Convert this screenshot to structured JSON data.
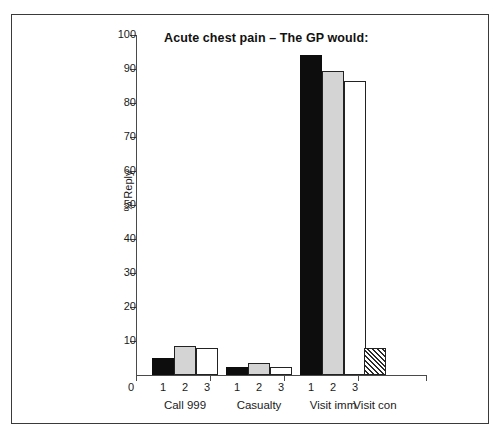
{
  "chart_data": {
    "type": "bar",
    "title": "Acute chest pain – The GP would:",
    "xlabel": "",
    "ylabel": "% Reply",
    "ylim": [
      0,
      100
    ],
    "ytick_step": 10,
    "ytick_labels": [
      "0",
      "10",
      "20",
      "30",
      "40",
      "50",
      "60",
      "70",
      "80",
      "90",
      "100"
    ],
    "grid": false,
    "legend": "none",
    "categories": [
      "Call 999",
      "Casualty",
      "Visit imm",
      "Visit con"
    ],
    "sub_labels": [
      "1",
      "2",
      "3"
    ],
    "series": [
      {
        "name": "1",
        "fill": "black",
        "values": [
          5,
          2.5,
          94,
          null
        ]
      },
      {
        "name": "2",
        "fill": "grey",
        "values": [
          8.5,
          3.5,
          89.5,
          null
        ]
      },
      {
        "name": "3",
        "fill": "white",
        "values": [
          8,
          2.5,
          86.5,
          null
        ]
      },
      {
        "name": "hatched",
        "fill": "hatch",
        "values": [
          null,
          null,
          null,
          8
        ]
      }
    ],
    "groups": [
      {
        "label": "Call 999",
        "bars": [
          {
            "sub_label": "1",
            "value": 5,
            "fill": "black"
          },
          {
            "sub_label": "2",
            "value": 8.5,
            "fill": "grey"
          },
          {
            "sub_label": "3",
            "value": 8,
            "fill": "white"
          }
        ]
      },
      {
        "label": "Casualty",
        "bars": [
          {
            "sub_label": "1",
            "value": 2.5,
            "fill": "black"
          },
          {
            "sub_label": "2",
            "value": 3.5,
            "fill": "grey"
          },
          {
            "sub_label": "3",
            "value": 2.5,
            "fill": "white"
          }
        ]
      },
      {
        "label": "Visit imm",
        "bars": [
          {
            "sub_label": "1",
            "value": 94,
            "fill": "black"
          },
          {
            "sub_label": "2",
            "value": 89.5,
            "fill": "grey"
          },
          {
            "sub_label": "3",
            "value": 86.5,
            "fill": "white"
          }
        ]
      },
      {
        "label": "Visit con",
        "bars": [
          {
            "sub_label": "",
            "value": 8,
            "fill": "hatch"
          }
        ]
      }
    ],
    "colors": {
      "series_1": "#0d0d0d",
      "series_2": "#d4d4d4",
      "series_3": "#ffffff",
      "hatch": "#2b2b2b",
      "axis": "#4a4a4a",
      "text": "#1a1a1a",
      "frame": "#3a3a3a",
      "background": "#ffffff"
    }
  }
}
